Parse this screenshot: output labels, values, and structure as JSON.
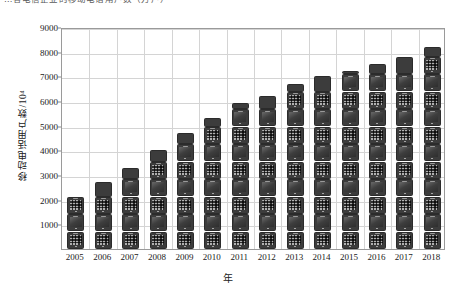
{
  "caption": {
    "text": "…各电信企业的移动电话用户数（万户）"
  },
  "chart_data": {
    "type": "bar",
    "title": "",
    "xlabel": "年",
    "ylabel": "移动电话用户数/10⁴",
    "categories": [
      "2005",
      "2006",
      "2007",
      "2008",
      "2009",
      "2010",
      "2011",
      "2012",
      "2013",
      "2014",
      "2015",
      "2016",
      "2017",
      "2018"
    ],
    "values": [
      2200,
      2700,
      3300,
      4000,
      4700,
      5300,
      5900,
      6200,
      6700,
      7000,
      7200,
      7500,
      7800,
      8200
    ],
    "ylim": [
      0,
      9000
    ],
    "yticks": [
      1000,
      2000,
      3000,
      4000,
      5000,
      6000,
      7000,
      8000,
      9000
    ],
    "ytick_labels": [
      "1000",
      "2000",
      "3000",
      "4000",
      "5000",
      "6000",
      "7000",
      "8000",
      "9000"
    ],
    "grid": true,
    "legend": "none",
    "bar_style": "pictorial-mobile-phone",
    "series": [
      {
        "name": "移动电话用户数",
        "values": [
          2200,
          2700,
          3300,
          4000,
          4700,
          5300,
          5900,
          6200,
          6700,
          7000,
          7200,
          7500,
          7800,
          8200
        ]
      }
    ]
  }
}
